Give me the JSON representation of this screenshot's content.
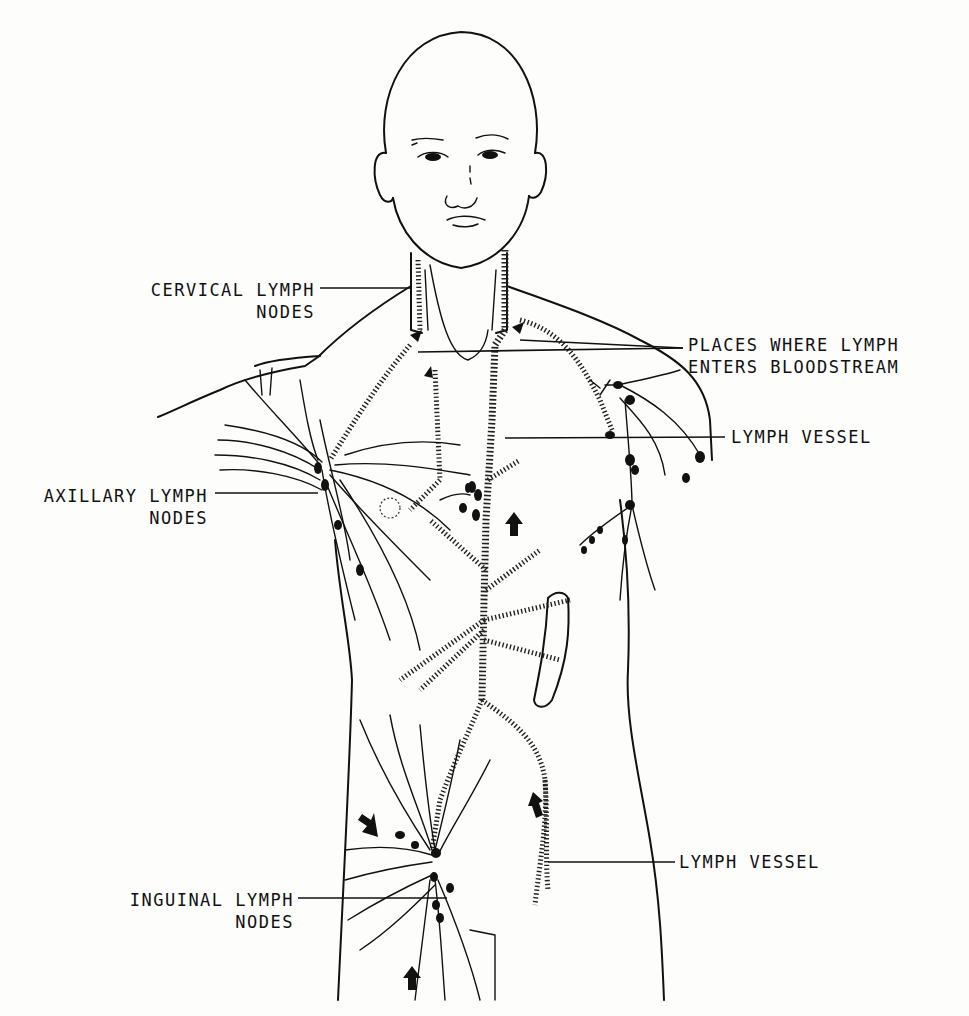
{
  "diagram": {
    "labels": {
      "cervical": {
        "line1": "CERVICAL LYMPH",
        "line2": "NODES"
      },
      "places_entry": {
        "line1": "PLACES WHERE LYMPH",
        "line2": "ENTERS BLOODSTREAM"
      },
      "lymph_vessel_upper": {
        "line1": "LYMPH VESSEL"
      },
      "axillary": {
        "line1": "AXILLARY LYMPH",
        "line2": "NODES"
      },
      "lymph_vessel_lower": {
        "line1": "LYMPH VESSEL"
      },
      "inguinal": {
        "line1": "INGUINAL LYMPH",
        "line2": "NODES"
      }
    },
    "colors": {
      "ink": "#111111",
      "paper": "#fdfdfc"
    }
  }
}
